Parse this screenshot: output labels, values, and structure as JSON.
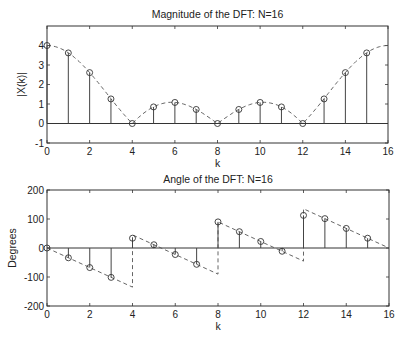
{
  "chart_data": [
    {
      "type": "stem",
      "title": "Magnitude of the DFT: N=16",
      "xlabel": "k",
      "ylabel": "|X(k)|",
      "xlim": [
        0,
        16
      ],
      "ylim": [
        -1,
        5
      ],
      "xticks": [
        0,
        2,
        4,
        6,
        8,
        10,
        12,
        14,
        16
      ],
      "yticks": [
        -1,
        0,
        1,
        2,
        3,
        4
      ],
      "grid": false,
      "x": [
        0,
        1,
        2,
        3,
        4,
        5,
        6,
        7,
        8,
        9,
        10,
        11,
        12,
        13,
        14,
        15
      ],
      "values": [
        4,
        3.62,
        2.61,
        1.26,
        0,
        0.85,
        1.08,
        0.72,
        0,
        0.72,
        1.08,
        0.85,
        0,
        1.26,
        2.61,
        3.62
      ],
      "overlay": {
        "style": "dashed",
        "description": "continuous DTFT magnitude |sin(pi k/4)/sin(pi k/16)|"
      }
    },
    {
      "type": "stem",
      "title": "Angle of the DFT: N=16",
      "xlabel": "k",
      "ylabel": "Degrees",
      "xlim": [
        0,
        16
      ],
      "ylim": [
        -200,
        200
      ],
      "xticks": [
        0,
        2,
        4,
        6,
        8,
        10,
        12,
        14,
        16
      ],
      "yticks": [
        -200,
        -100,
        0,
        100,
        200
      ],
      "grid": false,
      "x": [
        0,
        1,
        2,
        3,
        4,
        5,
        6,
        7,
        8,
        9,
        10,
        11,
        12,
        13,
        14,
        15
      ],
      "values": [
        0,
        -33.75,
        -67.5,
        -101.25,
        33.75,
        11.25,
        -22.5,
        -56.25,
        90,
        56.25,
        22.5,
        -11.25,
        112.5,
        101.25,
        67.5,
        33.75
      ],
      "overlay": {
        "style": "dashed",
        "description": "continuous DTFT phase, linear -33.75 deg per k with jumps at k=4, 8, 12",
        "segments": [
          [
            [
              0,
              0
            ],
            [
              4,
              -135
            ],
            [
              4,
              45
            ],
            [
              8,
              -90
            ],
            [
              8,
              90
            ],
            [
              12,
              -45
            ],
            [
              12,
              135
            ],
            [
              16,
              0
            ]
          ]
        ]
      }
    }
  ]
}
